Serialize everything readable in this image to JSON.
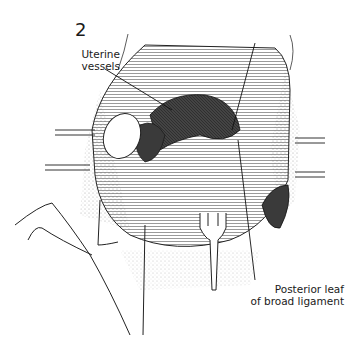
{
  "figure": {
    "number": "2",
    "labels": {
      "uterine_vessels_line1": "Uterine",
      "uterine_vessels_line2": "vessels",
      "posterior_leaf_line1": "Posterior leaf",
      "posterior_leaf_line2": "of broad ligament"
    },
    "colors": {
      "ink": "#1a1a1a",
      "background": "#ffffff",
      "shade_dark": "#3a3a3a"
    }
  }
}
